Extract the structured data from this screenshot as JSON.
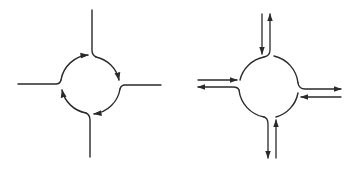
{
  "figure": {
    "colors": {
      "ink": "#2a2a2a",
      "background": "#ffffff"
    },
    "panels": [
      {
        "id": "left",
        "label": "roundabout-circulating-flow",
        "center": [
          91,
          85
        ],
        "radius": 30,
        "arms": [
          "north",
          "east",
          "south",
          "west"
        ],
        "circulation": "clockwise",
        "arrows_on_ring": 4
      },
      {
        "id": "right",
        "label": "roundabout-entry-exit-flows",
        "center": [
          269,
          87
        ],
        "radius": 31,
        "arms": [
          "north",
          "east",
          "south",
          "west"
        ],
        "arm_flows": [
          {
            "arm": "north",
            "in": "down",
            "out": "up"
          },
          {
            "arm": "west",
            "in": "right",
            "out": "left"
          },
          {
            "arm": "east",
            "in": "left",
            "out": "right"
          },
          {
            "arm": "south",
            "in": "up",
            "out": "down"
          }
        ]
      }
    ]
  }
}
